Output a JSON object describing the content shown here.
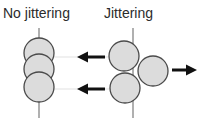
{
  "figure": {
    "title_left": "No jittering",
    "title_right": "Jittering",
    "colors": {
      "circle_fill": "#dcdcdc",
      "circle_stroke": "#4a4a4a",
      "axis_line": "#8f8f8f",
      "guide_line": "#e2e2e2",
      "arrow": "#111111",
      "text": "#2b2b2b",
      "background": "#ffffff"
    },
    "panels": [
      {
        "name": "no-jittering",
        "label": "No jittering",
        "axis": {
          "x": 39,
          "y1": 28,
          "y2": 118
        },
        "circles": [
          {
            "name": "circle-top",
            "cx": 39,
            "cy": 53,
            "r": 15
          },
          {
            "name": "circle-middle",
            "cx": 39,
            "cy": 69,
            "r": 15
          },
          {
            "name": "circle-bottom",
            "cx": 39,
            "cy": 87,
            "r": 15
          }
        ],
        "guides": [
          {
            "name": "guide-upper",
            "x1": 50,
            "y1": 57,
            "x2": 120,
            "y2": 57
          },
          {
            "name": "guide-lower",
            "x1": 50,
            "y1": 89,
            "x2": 120,
            "y2": 89
          }
        ]
      },
      {
        "name": "jittering",
        "label": "Jittering",
        "axis": {
          "x": 133,
          "y1": 28,
          "y2": 118
        },
        "circles": [
          {
            "name": "circle-upper-left",
            "cx": 124,
            "cy": 56,
            "r": 15
          },
          {
            "name": "circle-right",
            "cx": 153,
            "cy": 71,
            "r": 15
          },
          {
            "name": "circle-lower-left",
            "cx": 125,
            "cy": 88,
            "r": 15
          }
        ],
        "guides": []
      }
    ],
    "arrows": [
      {
        "name": "arrow-left-upper",
        "direction": "left",
        "x_tail": 105,
        "x_head": 77,
        "y": 57
      },
      {
        "name": "arrow-left-lower",
        "direction": "left",
        "x_tail": 105,
        "x_head": 77,
        "y": 89
      },
      {
        "name": "arrow-right",
        "direction": "right",
        "x_tail": 172,
        "x_head": 197,
        "y": 70
      }
    ]
  }
}
